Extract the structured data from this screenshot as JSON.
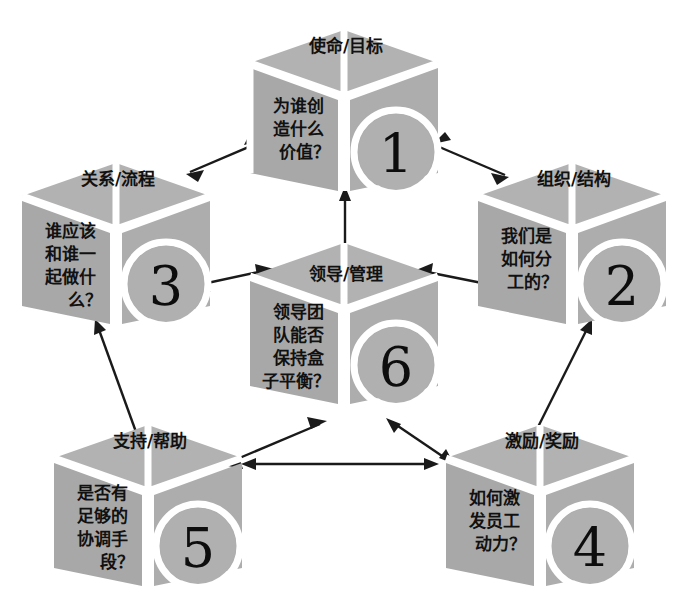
{
  "diagram": {
    "background_color": "#ffffff",
    "face_colors": {
      "top": "#b2b2b2",
      "left": "#a8a8a8",
      "right": "#adadad",
      "gap": "#ffffff",
      "line": "#1a1a1a"
    },
    "boxes": [
      {
        "id": "box-1",
        "number": "1",
        "category": "使命/目标",
        "question_lines": [
          "为谁创",
          "造什么",
          "价值？"
        ]
      },
      {
        "id": "box-2",
        "number": "2",
        "category": "组织/结构",
        "question_lines": [
          "我们是",
          "如何分",
          "工的？"
        ]
      },
      {
        "id": "box-3",
        "number": "3",
        "category": "关系/流程",
        "question_lines": [
          "谁应该",
          "和谁一",
          "起做什",
          "么？"
        ]
      },
      {
        "id": "box-4",
        "number": "4",
        "category": "激励/奖励",
        "question_lines": [
          "如何激",
          "发员工",
          "动力？"
        ]
      },
      {
        "id": "box-5",
        "number": "5",
        "category": "支持/帮助",
        "question_lines": [
          "是否有",
          "足够的",
          "协调手",
          "段？"
        ]
      },
      {
        "id": "box-6",
        "number": "6",
        "category": "领导/管理",
        "question_lines": [
          "领导团",
          "队能否",
          "保持盒",
          "子平衡？"
        ]
      }
    ],
    "connectors": [
      {
        "id": "c-1-3",
        "from": "box-1",
        "to": "box-3",
        "style": "double-arrow"
      },
      {
        "id": "c-1-2",
        "from": "box-1",
        "to": "box-2",
        "style": "double-arrow"
      },
      {
        "id": "c-1-6",
        "from": "box-1",
        "to": "box-6",
        "style": "double-arrow"
      },
      {
        "id": "c-3-6",
        "from": "box-3",
        "to": "box-6",
        "style": "double-arrow"
      },
      {
        "id": "c-2-6",
        "from": "box-2",
        "to": "box-6",
        "style": "double-arrow"
      },
      {
        "id": "c-3-5",
        "from": "box-3",
        "to": "box-5",
        "style": "double-arrow"
      },
      {
        "id": "c-2-4",
        "from": "box-2",
        "to": "box-4",
        "style": "double-arrow"
      },
      {
        "id": "c-5-6",
        "from": "box-5",
        "to": "box-6",
        "style": "double-arrow"
      },
      {
        "id": "c-4-6",
        "from": "box-4",
        "to": "box-6",
        "style": "double-arrow"
      },
      {
        "id": "c-5-4",
        "from": "box-5",
        "to": "box-4",
        "style": "double-arrow"
      }
    ]
  }
}
